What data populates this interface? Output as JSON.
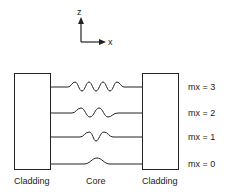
{
  "axes": {
    "vertical_label": "z",
    "horizontal_label": "x"
  },
  "regions": {
    "left_label": "Cladding",
    "center_label": "Core",
    "right_label": "Cladding"
  },
  "modes": [
    {
      "label": "mx = 3",
      "order": 3
    },
    {
      "label": "mx = 2",
      "order": 2
    },
    {
      "label": "mx = 1",
      "order": 1
    },
    {
      "label": "mx = 0",
      "order": 0
    }
  ],
  "colors": {
    "stroke": "#222222",
    "background": "#ffffff"
  }
}
